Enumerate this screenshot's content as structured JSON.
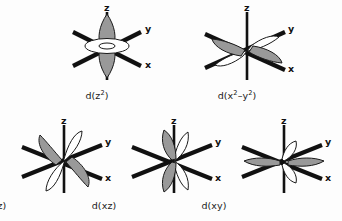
{
  "figure": {
    "background_color": "#fdfdfd",
    "lobe_fill_grey": "#999999",
    "lobe_fill_white": "#ffffff",
    "lobe_stroke": "#1a1a1a",
    "axis_color": "#111111",
    "axis_labels": {
      "z": "z",
      "y": "y",
      "x": "x"
    },
    "orbitals": [
      {
        "id": "dz2",
        "name": "d-z-squared-orbital",
        "caption_text": "d(z",
        "caption_sup": "2",
        "caption_tail": ")",
        "caption_plain": "d(z2)",
        "lobe_orientation": "vertical lobes along z with toroidal ring in xy plane",
        "grey_lobes": 2,
        "white_lobes": 1,
        "row": 1,
        "column": 1
      },
      {
        "id": "dx2y2",
        "name": "d-x-squared-minus-y-squared-orbital",
        "caption_text": "d(x",
        "caption_sup": "2",
        "caption_mid": "–y",
        "caption_sup2": "2",
        "caption_tail": ")",
        "caption_plain": "d(x2-y2)",
        "lobe_orientation": "lobes along x and y axes",
        "grey_lobes": 2,
        "white_lobes": 2,
        "row": 1,
        "column": 2
      },
      {
        "id": "dyz",
        "name": "d-yz-orbital",
        "caption_plain": "d(yz)",
        "lobe_orientation": "lobes between y and z axes",
        "grey_lobes": 2,
        "white_lobes": 2,
        "row": 2,
        "column": 1
      },
      {
        "id": "dxz",
        "name": "d-xz-orbital",
        "caption_plain": "d(xz)",
        "lobe_orientation": "lobes between x and z axes",
        "grey_lobes": 2,
        "white_lobes": 2,
        "row": 2,
        "column": 2
      },
      {
        "id": "dxy",
        "name": "d-xy-orbital",
        "caption_plain": "d(xy)",
        "lobe_orientation": "lobes between x and y axes",
        "grey_lobes": 2,
        "white_lobes": 2,
        "row": 2,
        "column": 3
      }
    ]
  }
}
